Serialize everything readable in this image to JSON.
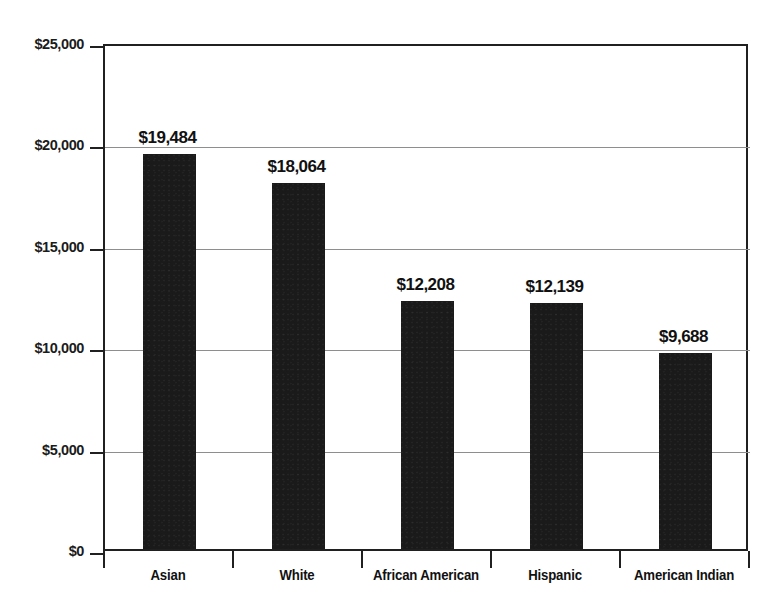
{
  "chart_data": {
    "type": "bar",
    "title": "",
    "subtitle": "",
    "xlabel": "",
    "ylabel": "",
    "categories": [
      "Asian",
      "White",
      "African American",
      "Hispanic",
      "American Indian"
    ],
    "values": [
      19484,
      18064,
      12208,
      12139,
      9688
    ],
    "value_labels": [
      "$19,484",
      "$18,064",
      "$12,208",
      "$12,139",
      "$9,688"
    ],
    "ylim": [
      0,
      25000
    ],
    "ytick_values": [
      0,
      5000,
      10000,
      15000,
      20000,
      25000
    ],
    "ytick_labels": [
      "$0",
      "$5,000",
      "$10,000",
      "$15,000",
      "$20,000",
      "$25,000"
    ],
    "grid": true,
    "grid_axis": "y",
    "legend": false,
    "legend_position": "none",
    "bar_color": "#1a1a1a",
    "grid_color": "#8e8e8e",
    "axis_color": "#202020",
    "background_color": "#ffffff",
    "annotations": []
  }
}
